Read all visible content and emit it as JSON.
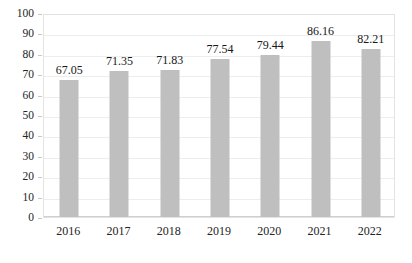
{
  "chart_data": {
    "type": "bar",
    "title": "",
    "subtitle": "",
    "xlabel": "",
    "ylabel": "",
    "categories": [
      "2016",
      "2017",
      "2018",
      "2019",
      "2020",
      "2021",
      "2022"
    ],
    "values": [
      67.05,
      71.35,
      71.83,
      77.54,
      79.44,
      86.16,
      82.21
    ],
    "data_labels": [
      "67.05",
      "71.35",
      "71.83",
      "77.54",
      "79.44",
      "86.16",
      "82.21"
    ],
    "ylim": [
      0,
      100
    ],
    "ytick_step": 10,
    "ytick_labels": [
      "100",
      "90",
      "80",
      "70",
      "60",
      "50",
      "40",
      "30",
      "20",
      "10",
      "0"
    ],
    "ytick_values": [
      100,
      90,
      80,
      70,
      60,
      50,
      40,
      30,
      20,
      10,
      0
    ],
    "grid": true,
    "grid_axis": "y",
    "legend": false,
    "legend_position": "none",
    "series": [
      {
        "name": "",
        "values": [
          67.05,
          71.35,
          71.83,
          77.54,
          79.44,
          86.16,
          82.21
        ]
      }
    ],
    "colors": {
      "bar": "#bfbfbf",
      "gridline": "#ededed",
      "plot_border": "#e3e3e3",
      "text": "#242424",
      "background": "#ffffff"
    }
  }
}
